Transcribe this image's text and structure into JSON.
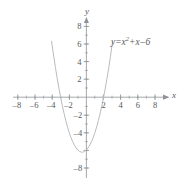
{
  "figure": {
    "title": "",
    "equation": {
      "lhs": "y",
      "equals": "=",
      "var1": "x",
      "exponent": "2",
      "plus": "+",
      "var2": "x",
      "minus": "–",
      "constant": "6",
      "full_text": "y = x² + x – 6"
    },
    "x_axis_name": "x",
    "y_axis_name": "y"
  },
  "chart_data": {
    "type": "line",
    "xlabel": "x",
    "ylabel": "y",
    "xlim": [
      -9.2,
      9.5
    ],
    "ylim": [
      -9.2,
      9.2
    ],
    "grid": false,
    "legend": "none",
    "annotations": [
      {
        "text": "y = x² + x – 6",
        "x": 3.0,
        "y": 6.0
      }
    ],
    "x_ticks": [
      -8,
      -6,
      -4,
      -2,
      2,
      4,
      6,
      8
    ],
    "x_tick_labels": [
      "–8",
      "–6",
      "–4",
      "–2",
      "2",
      "4",
      "6",
      "8"
    ],
    "y_ticks": [
      8,
      6,
      4,
      2,
      -2,
      -4,
      -8
    ],
    "y_tick_labels": [
      "8",
      "6",
      "4",
      "2",
      "–2",
      "–4",
      "–8"
    ],
    "minor_tick_step": 1,
    "series": [
      {
        "name": "y = x² + x – 6",
        "color": "#b9bcbe",
        "equation": "y = x^2 + x - 6",
        "vertex": [
          -0.5,
          -6.25
        ],
        "roots": [
          -3,
          2
        ],
        "y_intercept": -6,
        "x": [
          -4.05,
          -3.8,
          -3.6,
          -3.4,
          -3.2,
          -3.0,
          -2.8,
          -2.6,
          -2.4,
          -2.2,
          -2.0,
          -1.8,
          -1.6,
          -1.4,
          -1.2,
          -1.0,
          -0.8,
          -0.6,
          -0.5,
          -0.4,
          -0.2,
          0.0,
          0.2,
          0.4,
          0.6,
          0.8,
          1.0,
          1.2,
          1.4,
          1.6,
          1.8,
          2.0,
          2.2,
          2.4,
          2.6,
          2.8,
          3.0,
          3.05
        ],
        "y": [
          6.35,
          4.64,
          3.36,
          2.16,
          1.04,
          0.0,
          -0.96,
          -1.84,
          -2.64,
          -3.36,
          -4.0,
          -4.56,
          -5.04,
          -5.44,
          -5.76,
          -6.0,
          -6.16,
          -6.24,
          -6.25,
          -6.24,
          -6.16,
          -6.0,
          -5.76,
          -5.44,
          -5.04,
          -4.56,
          -4.0,
          -3.36,
          -2.64,
          -1.84,
          -0.96,
          0.0,
          1.04,
          2.16,
          3.36,
          4.64,
          6.0,
          6.35
        ]
      }
    ]
  },
  "colors": {
    "axis": "#8e9295",
    "curve": "#b9bcbe",
    "text": "#55595c",
    "background": "#ffffff"
  }
}
